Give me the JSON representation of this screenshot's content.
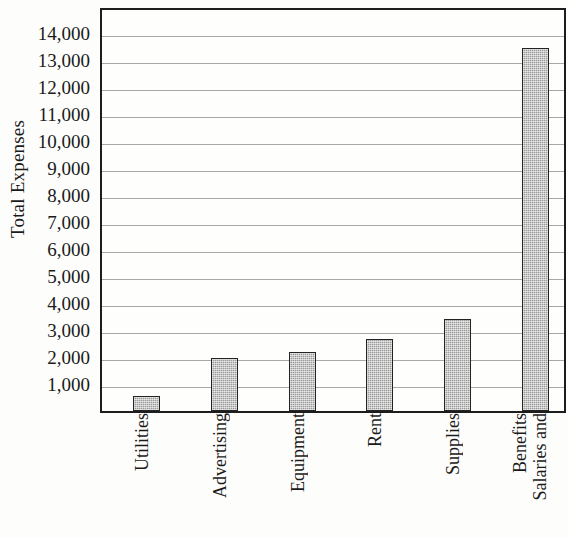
{
  "chart_data": {
    "type": "bar",
    "title": "",
    "xlabel": "",
    "ylabel": "Total Expenses",
    "categories": [
      "Utilities",
      "Advertising",
      "Equipment",
      "Rent",
      "Supplies",
      "Salaries and Benefits"
    ],
    "category_lines": [
      [
        "Utilities"
      ],
      [
        "Advertising"
      ],
      [
        "Equipment"
      ],
      [
        "Rent"
      ],
      [
        "Supplies"
      ],
      [
        "Salaries and",
        "Benefits"
      ]
    ],
    "values": [
      550,
      1950,
      2200,
      2650,
      3400,
      13450
    ],
    "ylim": [
      0,
      14600
    ],
    "ytick_values": [
      1000,
      2000,
      3000,
      4000,
      5000,
      6000,
      7000,
      8000,
      9000,
      10000,
      11000,
      12000,
      13000,
      14000
    ],
    "ytick_labels": [
      "1,000",
      "2,000",
      "3,000",
      "4,000",
      "5,000",
      "6,000",
      "7,000",
      "8,000",
      "9,000",
      "10,000",
      "11,000",
      "12,000",
      "13,000",
      "14,000"
    ],
    "grid": true,
    "legend": "none",
    "bar_fill_color": "#9a9a9a",
    "bar_edge_color": "#232323",
    "gridline_color": "#a8a8a8",
    "axis_color": "#1d1d1d",
    "background_color": "#fdfdfb"
  }
}
